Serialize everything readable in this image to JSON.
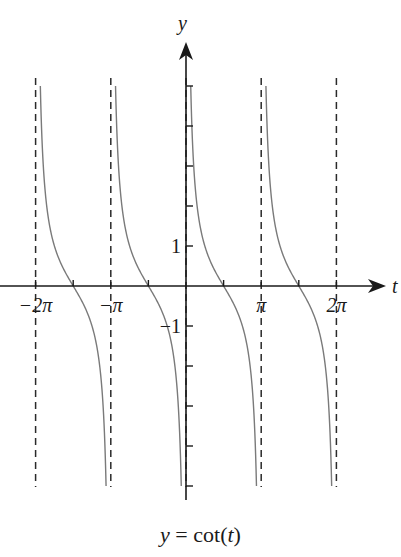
{
  "chart_data": {
    "type": "line",
    "title": "y = cot(t)",
    "caption": {
      "prefix": "y",
      "equals": "=",
      "func": "cot(",
      "arg": "t",
      "suffix": ")"
    },
    "xlabel": "t",
    "ylabel": "y",
    "xlim": [
      -7.4,
      7.4
    ],
    "ylim": [
      -5.3,
      6.0
    ],
    "grid": false,
    "x_tick_labels": [
      {
        "value": -6.283185,
        "label": "−2π"
      },
      {
        "value": -3.141593,
        "label": "−π"
      },
      {
        "value": 3.141593,
        "label": "π"
      },
      {
        "value": 6.283185,
        "label": "2π"
      }
    ],
    "x_minor_ticks": [
      -4.712389,
      -1.570796,
      1.570796,
      4.712389
    ],
    "y_tick_labels": [
      {
        "value": 1,
        "label": "1"
      },
      {
        "value": -1,
        "label": "−1"
      }
    ],
    "y_ticks": [
      -5,
      -4,
      -3,
      -2,
      -1,
      1,
      2,
      3,
      4,
      5
    ],
    "asymptotes": [
      -6.283185,
      -3.141593,
      0,
      3.141593,
      6.283185
    ],
    "series": [
      {
        "name": "cot(t)",
        "color": "#7a7a7a",
        "branches": [
          {
            "t_start": -6.283185,
            "t_end": -3.141593
          },
          {
            "t_start": -3.141593,
            "t_end": 0
          },
          {
            "t_start": 0,
            "t_end": 3.141593
          },
          {
            "t_start": 3.141593,
            "t_end": 6.283185
          }
        ],
        "y_clip": [
          -5,
          5
        ],
        "sample_points": [
          {
            "t": -5.497787,
            "y": 1
          },
          {
            "t": -4.712389,
            "y": 0
          },
          {
            "t": -3.926991,
            "y": -1
          },
          {
            "t": -2.356194,
            "y": 1
          },
          {
            "t": -1.570796,
            "y": 0
          },
          {
            "t": -0.785398,
            "y": -1
          },
          {
            "t": 0.785398,
            "y": 1
          },
          {
            "t": 1.570796,
            "y": 0
          },
          {
            "t": 2.356194,
            "y": -1
          },
          {
            "t": 3.926991,
            "y": 1
          },
          {
            "t": 4.712389,
            "y": 0
          },
          {
            "t": 5.497787,
            "y": -1
          }
        ]
      }
    ]
  },
  "colors": {
    "axis": "#1a1a1a",
    "asymptote": "#2a2a2a",
    "curve": "#7a7a7a",
    "background": "#ffffff"
  }
}
